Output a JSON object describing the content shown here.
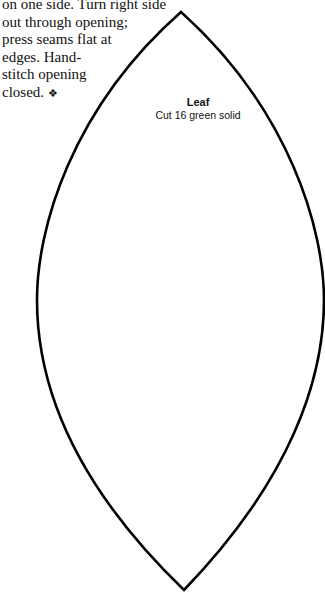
{
  "instructions": {
    "lines": [
      "on one side. Turn right side",
      "out through opening;",
      "press seams flat at",
      "edges. Hand-",
      "stitch opening",
      "closed."
    ],
    "end_mark_icon": "❖"
  },
  "pattern_piece": {
    "name": "Leaf",
    "instruction": "Cut 16 green solid",
    "outline_color": "#000000"
  }
}
